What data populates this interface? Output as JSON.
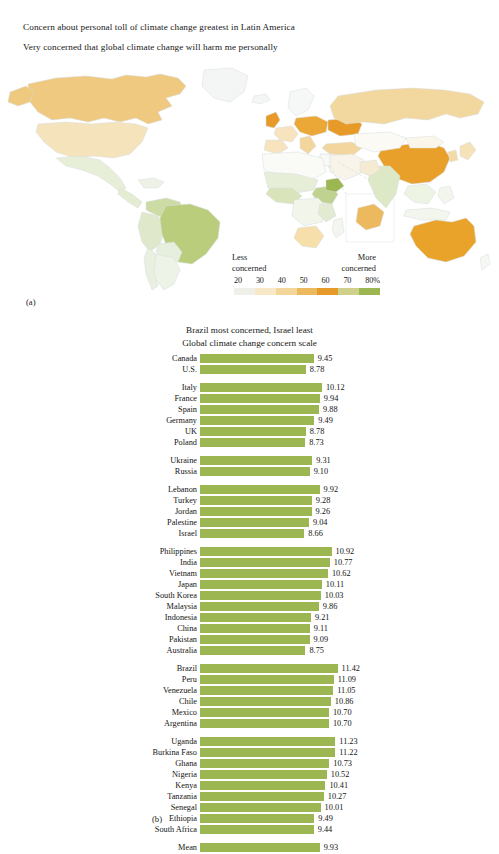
{
  "panel_a": {
    "panel_label": "(a)",
    "title": "Concern about personal toll of climate change greatest in Latin America",
    "subtitle": "Very concerned that global climate change will harm me personally",
    "legend": {
      "low_label_line1": "Less",
      "low_label_line2": "concerned",
      "high_label_line1": "More",
      "high_label_line2": "concerned",
      "ticks": [
        "20",
        "30",
        "40",
        "50",
        "60",
        "70",
        "80%"
      ],
      "colors": [
        "#f0f0e8",
        "#f7e9c8",
        "#f2d69a",
        "#ecb95e",
        "#e59a2a",
        "#cfd08a",
        "#9cb751"
      ]
    }
  },
  "panel_b": {
    "panel_label": "(b)",
    "title": "Brazil most concerned, Israel least",
    "subtitle": "Global climate change concern scale",
    "bar_color": "#9cb751",
    "axis_max": 12.2
  },
  "chart_data": {
    "type": "bar",
    "title": "Brazil most concerned, Israel least",
    "subtitle": "Global climate change concern scale",
    "xlabel": "",
    "ylabel": "",
    "xlim": [
      0,
      12.2
    ],
    "grid": false,
    "legend": "none",
    "orientation": "horizontal",
    "groups": [
      {
        "name": "North America",
        "categories": [
          "Canada",
          "U.S."
        ],
        "values": [
          9.45,
          8.78
        ]
      },
      {
        "name": "Europe (West)",
        "categories": [
          "Italy",
          "France",
          "Spain",
          "Germany",
          "UK",
          "Poland"
        ],
        "values": [
          10.12,
          9.94,
          9.88,
          9.49,
          8.78,
          8.73
        ]
      },
      {
        "name": "Eastern Europe",
        "categories": [
          "Ukraine",
          "Russia"
        ],
        "values": [
          9.31,
          9.1
        ]
      },
      {
        "name": "Middle East",
        "categories": [
          "Lebanon",
          "Turkey",
          "Jordan",
          "Palestine",
          "Israel"
        ],
        "values": [
          9.92,
          9.28,
          9.26,
          9.04,
          8.66
        ]
      },
      {
        "name": "Asia-Pacific",
        "categories": [
          "Philippines",
          "India",
          "Vietnam",
          "Japan",
          "South Korea",
          "Malaysia",
          "Indonesia",
          "China",
          "Pakistan",
          "Australia"
        ],
        "values": [
          10.92,
          10.77,
          10.62,
          10.11,
          10.03,
          9.86,
          9.21,
          9.11,
          9.09,
          8.75
        ]
      },
      {
        "name": "Latin America",
        "categories": [
          "Brazil",
          "Peru",
          "Venezuela",
          "Chile",
          "Mexico",
          "Argentina"
        ],
        "values": [
          11.42,
          11.09,
          11.05,
          10.86,
          10.7,
          10.7
        ]
      },
      {
        "name": "Africa",
        "categories": [
          "Uganda",
          "Burkina Faso",
          "Ghana",
          "Nigeria",
          "Kenya",
          "Tanzania",
          "Senegal",
          "Ethiopia",
          "South Africa"
        ],
        "values": [
          11.23,
          11.22,
          10.73,
          10.52,
          10.41,
          10.27,
          10.01,
          9.49,
          9.44
        ]
      },
      {
        "name": "Overall",
        "categories": [
          "Mean"
        ],
        "values": [
          9.93
        ]
      }
    ]
  },
  "map_data": {
    "type": "choropleth",
    "unit": "percent",
    "scale_min": 20,
    "scale_max": 80,
    "note": "Orange = less concerned, green = more concerned"
  }
}
